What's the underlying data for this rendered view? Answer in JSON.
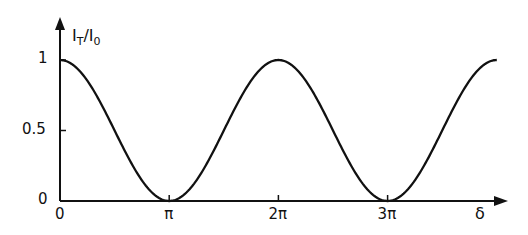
{
  "chart_data": {
    "type": "line",
    "title": "",
    "xlabel": "δ",
    "ylabel": "I_T/I_0",
    "ylabel_main": "I",
    "ylabel_sub_num": "T",
    "ylabel_sub_den": "0",
    "x_ticks": [
      {
        "value": 0,
        "label": "0"
      },
      {
        "value": 3.14159,
        "label": "π"
      },
      {
        "value": 6.28318,
        "label": "2π"
      },
      {
        "value": 9.42478,
        "label": "3π"
      }
    ],
    "y_ticks": [
      {
        "value": 0,
        "label": "0"
      },
      {
        "value": 0.5,
        "label": "0.5"
      },
      {
        "value": 1,
        "label": "1"
      }
    ],
    "xlim": [
      0,
      12.566
    ],
    "ylim": [
      0,
      1
    ],
    "grid": false,
    "series": [
      {
        "name": "I_T/I_0 = cos²(δ/2)",
        "function": "cos^2(delta/2)",
        "x": [
          0,
          1.5708,
          3.1416,
          4.7124,
          6.2832,
          7.854,
          9.4248,
          10.9956,
          12.566
        ],
        "values": [
          1,
          0.5,
          0,
          0.5,
          1,
          0.5,
          0,
          0.5,
          1
        ]
      }
    ]
  }
}
